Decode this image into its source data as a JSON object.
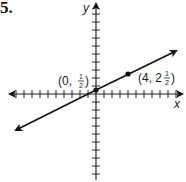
{
  "problem": {
    "number": "5."
  },
  "chart_data": {
    "type": "line",
    "title": "",
    "xlabel": "x",
    "ylabel": "y",
    "grid": false,
    "axis_ticks_spacing": 1,
    "xlim": [
      -11,
      11
    ],
    "ylim": [
      -11,
      11
    ],
    "series": [
      {
        "name": "line",
        "slope": 0.5,
        "intercept": 0.5,
        "x": [
          -10,
          10
        ],
        "y": [
          -4.5,
          5.5
        ]
      }
    ],
    "points": [
      {
        "x": 0,
        "y": 0.5,
        "label": "(0, 1/2)"
      },
      {
        "x": 4,
        "y": 2.5,
        "label": "(4, 2 1/2)"
      }
    ]
  },
  "labels": {
    "x_axis": "x",
    "y_axis": "y",
    "point1": {
      "open": "(0, ",
      "num": "1",
      "den": "2",
      "close": ")"
    },
    "point2": {
      "open": "(4, 2",
      "num": "1",
      "den": "2",
      "close": ")"
    }
  }
}
